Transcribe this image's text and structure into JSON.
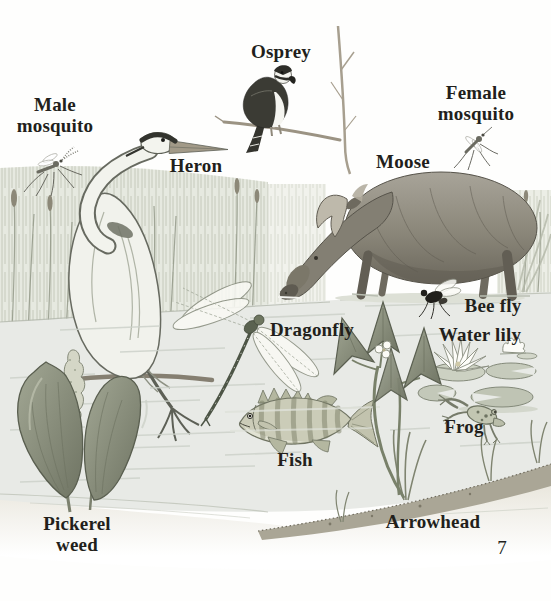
{
  "page": {
    "number": "7"
  },
  "labels": {
    "male_mosquito": "Male mosquito",
    "osprey": "Osprey",
    "female_mosquito": "Female mosquito",
    "heron": "Heron",
    "moose": "Moose",
    "bee_fly": "Bee fly",
    "dragonfly": "Dragonfly",
    "water_lily": "Water lily",
    "frog": "Frog",
    "fish": "Fish",
    "pickerel_weed": "Pickerel weed",
    "arrowhead": "Arrowhead"
  },
  "colors": {
    "label_text": "#221f1b",
    "paper": "#fefefd",
    "water": "#e8eae6",
    "sketch_dark": "#55584e",
    "sketch_mid": "#8b9080",
    "sketch_light": "#d9dcd2",
    "bank": "#aaa696"
  }
}
